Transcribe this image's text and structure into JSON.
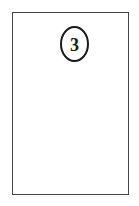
{
  "card": {
    "badge": {
      "number": "3"
    }
  },
  "colors": {
    "border": "#444444",
    "badge_outline": "#1a1a1a",
    "background": "#ffffff"
  }
}
